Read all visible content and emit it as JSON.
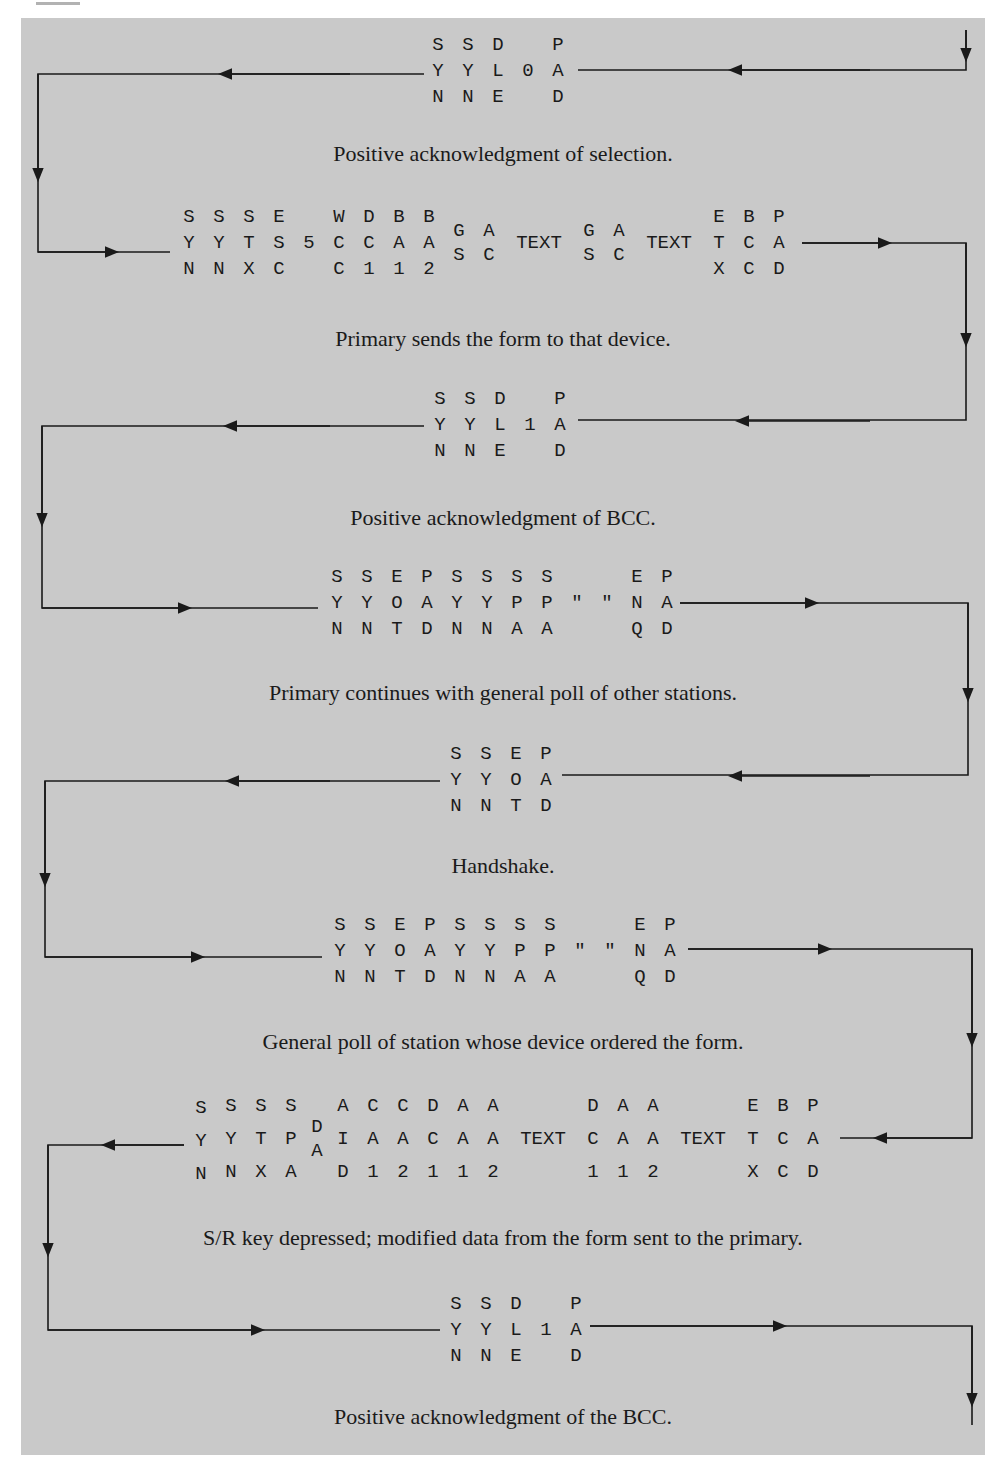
{
  "figure": {
    "background_color": "#c9c9c9",
    "line_color": "#1a1a1a",
    "steps": [
      {
        "id": "ack-selection",
        "direction": "right-to-left",
        "columns": [
          [
            "S",
            "Y",
            "N"
          ],
          [
            "S",
            "Y",
            "N"
          ],
          [
            "D",
            "L",
            "E"
          ],
          [
            "",
            "0",
            ""
          ],
          [
            "P",
            "A",
            "D"
          ]
        ],
        "caption": "Positive acknowledgment of selection."
      },
      {
        "id": "send-form",
        "direction": "left-to-right",
        "columns": [
          [
            "S",
            "Y",
            "N"
          ],
          [
            "S",
            "Y",
            "N"
          ],
          [
            "S",
            "T",
            "X"
          ],
          [
            "E",
            "S",
            "C"
          ],
          [
            "",
            "5",
            ""
          ],
          [
            "W",
            "C",
            "C"
          ],
          [
            "D",
            "C",
            "1"
          ],
          [
            "B",
            "A",
            "1"
          ],
          [
            "B",
            "A",
            "2"
          ],
          [
            "G",
            "",
            "S"
          ],
          [
            "A",
            "",
            "C"
          ],
          [
            "",
            "TEXT",
            ""
          ],
          [
            "G",
            "",
            "S"
          ],
          [
            "A",
            "",
            "C"
          ],
          [
            "",
            "TEXT",
            ""
          ],
          [
            "E",
            "T",
            "X"
          ],
          [
            "B",
            "C",
            "C"
          ],
          [
            "P",
            "A",
            "D"
          ]
        ],
        "caption": "Primary sends the form to that device."
      },
      {
        "id": "ack-bcc",
        "direction": "right-to-left",
        "columns": [
          [
            "S",
            "Y",
            "N"
          ],
          [
            "S",
            "Y",
            "N"
          ],
          [
            "D",
            "L",
            "E"
          ],
          [
            "",
            "1",
            ""
          ],
          [
            "P",
            "A",
            "D"
          ]
        ],
        "caption": "Positive acknowledgment of BCC."
      },
      {
        "id": "general-poll-others",
        "direction": "left-to-right",
        "columns": [
          [
            "S",
            "Y",
            "N"
          ],
          [
            "S",
            "Y",
            "N"
          ],
          [
            "E",
            "O",
            "T"
          ],
          [
            "P",
            "A",
            "D"
          ],
          [
            "S",
            "Y",
            "N"
          ],
          [
            "S",
            "Y",
            "N"
          ],
          [
            "S",
            "P",
            "A"
          ],
          [
            "S",
            "P",
            "A"
          ],
          [
            "",
            "\"",
            ""
          ],
          [
            "",
            "\"",
            ""
          ],
          [
            "E",
            "N",
            "Q"
          ],
          [
            "P",
            "A",
            "D"
          ]
        ],
        "caption": "Primary continues with general poll of other stations."
      },
      {
        "id": "handshake",
        "direction": "right-to-left",
        "columns": [
          [
            "S",
            "Y",
            "N"
          ],
          [
            "S",
            "Y",
            "N"
          ],
          [
            "E",
            "O",
            "T"
          ],
          [
            "P",
            "A",
            "D"
          ]
        ],
        "caption": "Handshake."
      },
      {
        "id": "general-poll-station",
        "direction": "left-to-right",
        "columns": [
          [
            "S",
            "Y",
            "N"
          ],
          [
            "S",
            "Y",
            "N"
          ],
          [
            "E",
            "O",
            "T"
          ],
          [
            "P",
            "A",
            "D"
          ],
          [
            "S",
            "Y",
            "N"
          ],
          [
            "S",
            "Y",
            "N"
          ],
          [
            "S",
            "P",
            "A"
          ],
          [
            "S",
            "P",
            "A"
          ],
          [
            "",
            "\"",
            ""
          ],
          [
            "",
            "\"",
            ""
          ],
          [
            "E",
            "N",
            "Q"
          ],
          [
            "P",
            "A",
            "D"
          ]
        ],
        "caption": "General poll of station whose device ordered the form."
      },
      {
        "id": "sr-key-data",
        "direction": "right-to-left",
        "columns": [
          [
            "S",
            "Y",
            "N"
          ],
          [
            "S",
            "Y",
            "N"
          ],
          [
            "S",
            "T",
            "X"
          ],
          [
            "S",
            "P",
            "A"
          ],
          [
            "",
            "D/A",
            ""
          ],
          [
            "A",
            "I",
            "D"
          ],
          [
            "C",
            "A",
            "1"
          ],
          [
            "C",
            "A",
            "2"
          ],
          [
            "D",
            "C",
            "1"
          ],
          [
            "A",
            "A",
            "1"
          ],
          [
            "A",
            "A",
            "2"
          ],
          [
            "",
            "TEXT",
            ""
          ],
          [
            "D",
            "C",
            "1"
          ],
          [
            "A",
            "A",
            "1"
          ],
          [
            "A",
            "A",
            "2"
          ],
          [
            "",
            "TEXT",
            ""
          ],
          [
            "E",
            "T",
            "X"
          ],
          [
            "B",
            "C",
            "C"
          ],
          [
            "P",
            "A",
            "D"
          ]
        ],
        "caption": "S/R key depressed; modified data from the form sent to the primary."
      },
      {
        "id": "ack-the-bcc",
        "direction": "left-to-right",
        "columns": [
          [
            "S",
            "Y",
            "N"
          ],
          [
            "S",
            "Y",
            "N"
          ],
          [
            "D",
            "L",
            "E"
          ],
          [
            "",
            "1",
            ""
          ],
          [
            "P",
            "A",
            "D"
          ]
        ],
        "caption": "Positive acknowledgment of the BCC."
      }
    ]
  }
}
